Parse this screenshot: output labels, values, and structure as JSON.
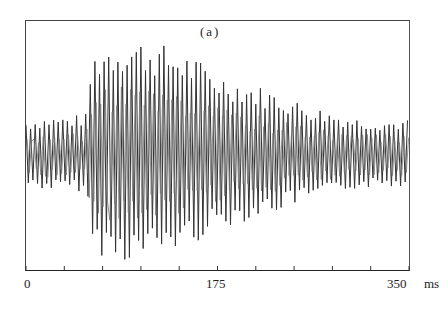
{
  "chart_data": {
    "type": "line",
    "title": "(a)",
    "xlabel": "ms",
    "ylabel": "",
    "x_ticks": [
      "0",
      "175",
      "350"
    ],
    "x_unit": "ms",
    "xlim": [
      0,
      350
    ],
    "minor_tick_interval_ms": 35,
    "grid": false,
    "legend": null,
    "envelope": {
      "t_ms": [
        0,
        20,
        40,
        55,
        60,
        70,
        90,
        110,
        130,
        150,
        175,
        200,
        225,
        250,
        275,
        300,
        325,
        350
      ],
      "amplitude": [
        0.3,
        0.33,
        0.33,
        0.35,
        0.85,
        0.95,
        1.0,
        0.98,
        0.92,
        0.85,
        0.7,
        0.62,
        0.55,
        0.45,
        0.38,
        0.32,
        0.3,
        0.3
      ]
    },
    "period_ms": 4.2
  },
  "axis": {
    "label_0": "0",
    "label_175": "175",
    "label_350": "350",
    "unit": "ms"
  }
}
